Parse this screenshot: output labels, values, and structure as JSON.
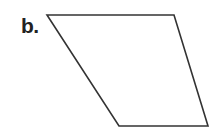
{
  "figure": {
    "label": "b.",
    "shape": {
      "type": "parallelogram",
      "vertices": [
        [
          47,
          15
        ],
        [
          174,
          15
        ],
        [
          208,
          126
        ],
        [
          119,
          126
        ]
      ],
      "stroke": "#333333",
      "fill": "#ffffff"
    }
  }
}
